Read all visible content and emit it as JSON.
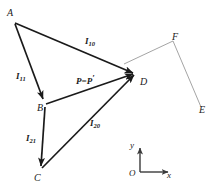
{
  "figure": {
    "type": "vector-diagram",
    "background_color": "#ffffff",
    "stroke_color": "#1a1a1a",
    "light_stroke_color": "#9a9a9a",
    "points": {
      "A": {
        "label": "A",
        "x": 14,
        "y": 22
      },
      "B": {
        "label": "B",
        "x": 44,
        "y": 104
      },
      "C": {
        "label": "C",
        "x": 41,
        "y": 170
      },
      "D": {
        "label": "D",
        "x": 138,
        "y": 75
      },
      "E": {
        "label": "E",
        "x": 200,
        "y": 108
      },
      "F": {
        "label": "F",
        "x": 172,
        "y": 43
      }
    },
    "vectors": [
      {
        "name": "I10",
        "label": "I",
        "subscript": "10",
        "from": "A",
        "to": "D"
      },
      {
        "name": "I11",
        "label": "I",
        "subscript": "11",
        "from": "A",
        "to": "B"
      },
      {
        "name": "I21",
        "label": "I",
        "subscript": "21",
        "from": "B",
        "to": "C"
      },
      {
        "name": "I20",
        "label": "I",
        "subscript": "20",
        "from": "C",
        "to": "D"
      },
      {
        "name": "P",
        "label": "P=P",
        "prime": "′",
        "from": "B",
        "to": "D"
      }
    ],
    "guide_line": {
      "name": "EF-line",
      "from": "F",
      "to": "E"
    },
    "axes": {
      "origin_label": "O",
      "y_label": "y",
      "x_label": "x",
      "origin_x": 140,
      "origin_y": 172,
      "y_top": 144,
      "x_right": 173
    }
  }
}
